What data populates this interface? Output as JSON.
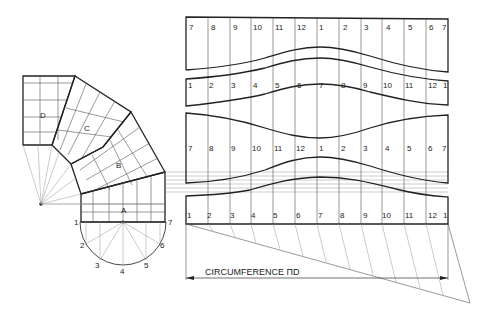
{
  "diagram": {
    "type": "technical-drawing",
    "segments": [
      {
        "id": "A",
        "label": "A"
      },
      {
        "id": "B",
        "label": "B"
      },
      {
        "id": "C",
        "label": "C"
      },
      {
        "id": "D",
        "label": "D"
      }
    ],
    "semicircle_points": [
      "1",
      "2",
      "3",
      "4",
      "5",
      "6",
      "7"
    ],
    "pattern_strips": [
      {
        "name": "strip-1",
        "labels": [
          "7",
          "8",
          "9",
          "10",
          "11",
          "12",
          "1",
          "2",
          "3",
          "4",
          "5",
          "6",
          "7"
        ]
      },
      {
        "name": "strip-2",
        "labels": [
          "1",
          "2",
          "3",
          "4",
          "5",
          "6",
          "7",
          "8",
          "9",
          "10",
          "11",
          "12",
          "1"
        ]
      },
      {
        "name": "strip-3",
        "labels": [
          "7",
          "8",
          "9",
          "10",
          "11",
          "12",
          "1",
          "2",
          "3",
          "4",
          "5",
          "6",
          "7"
        ]
      },
      {
        "name": "strip-4",
        "labels": [
          "1",
          "2",
          "3",
          "4",
          "5",
          "6",
          "7",
          "8",
          "9",
          "10",
          "11",
          "12",
          "1"
        ]
      }
    ],
    "dimension_label": "CIRCUMFERENCE ΠD",
    "colors": {
      "line": "#222222",
      "background": "#ffffff"
    }
  }
}
